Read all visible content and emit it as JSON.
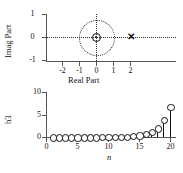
{
  "figure": {
    "panels": [
      "pole-zero-plot",
      "impulse-response-stem-plot"
    ]
  },
  "pole_zero": {
    "xlabel": "Real Part",
    "ylabel": "Imag Part",
    "xticks": [
      "-2",
      "-1",
      "0",
      "1",
      "2"
    ],
    "xtick_values": [
      -2,
      -1,
      0,
      1,
      2
    ],
    "yticks": [
      "1",
      "0",
      "-1"
    ],
    "ytick_values": [
      1,
      0,
      -1
    ],
    "unit_circle": true,
    "zero_marker": "o",
    "pole_marker": "x",
    "zeros": [
      {
        "re": 0,
        "im": 0
      }
    ],
    "poles": [
      {
        "re": 1.85,
        "im": 0
      }
    ]
  },
  "chart_data": {
    "type": "line",
    "subtype": "stem",
    "title": "",
    "xlabel": "n",
    "ylabel": "h3",
    "xlim": [
      0,
      21
    ],
    "ylim": [
      0,
      10
    ],
    "xticks": [
      0,
      5,
      10,
      15,
      20
    ],
    "xticklabels": [
      "0",
      "5",
      "10",
      "15",
      "20"
    ],
    "yticks": [
      0,
      5,
      10
    ],
    "yticklabels": [
      "0",
      "5",
      "10"
    ],
    "grid": false,
    "legend": null,
    "x": [
      1,
      2,
      3,
      4,
      5,
      6,
      7,
      8,
      9,
      10,
      11,
      12,
      13,
      14,
      15,
      16,
      17,
      18,
      19,
      20
    ],
    "values": [
      0.0,
      0.0,
      0.0,
      0.0,
      0.0,
      0.0,
      0.01,
      0.01,
      0.02,
      0.03,
      0.06,
      0.1,
      0.18,
      0.3,
      0.45,
      0.8,
      1.15,
      2.0,
      3.8,
      6.8
    ]
  }
}
